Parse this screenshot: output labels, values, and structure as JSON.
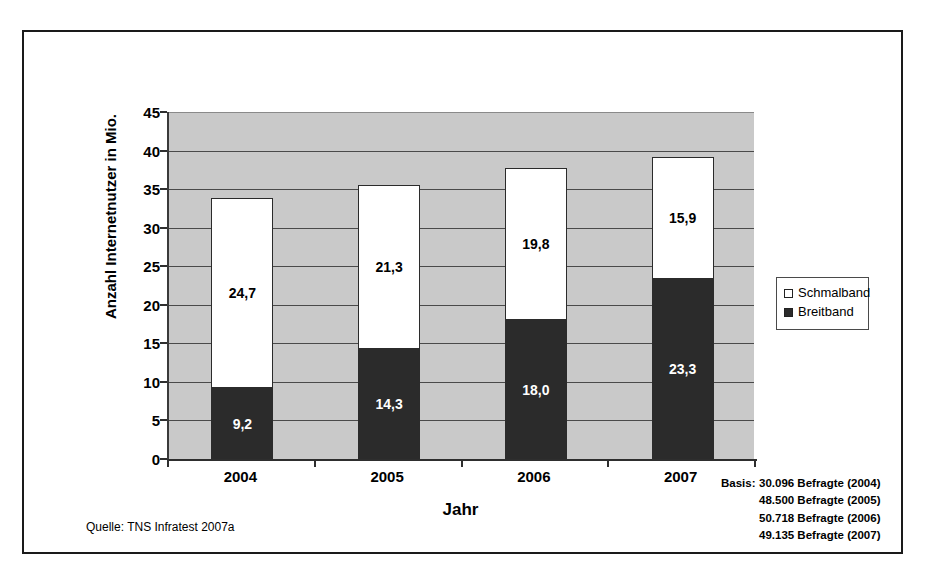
{
  "figure": {
    "source_note": "Quelle: TNS Infratest 2007a",
    "basis": {
      "label": "Basis:",
      "lines": [
        "30.096 Befragte (2004)",
        "48.500 Befragte (2005)",
        "50.718 Befragte (2006)",
        "49.135 Befragte (2007)"
      ]
    }
  },
  "legend": {
    "items": [
      {
        "label": "Schmalband",
        "swatch": "white-square-icon",
        "color": "#ffffff"
      },
      {
        "label": "Breitband",
        "swatch": "black-square-icon",
        "color": "#2b2b2b"
      }
    ]
  },
  "chart_data": {
    "type": "bar",
    "stacked": true,
    "title": "",
    "xlabel": "Jahr",
    "ylabel": "Anzahl Internetnutzer in Mio.",
    "categories": [
      "2004",
      "2005",
      "2006",
      "2007"
    ],
    "series": [
      {
        "name": "Breitband",
        "values": [
          9.2,
          14.3,
          18.0,
          23.3
        ],
        "labels": [
          "9,2",
          "14,3",
          "18,0",
          "23,3"
        ],
        "color": "#2b2b2b"
      },
      {
        "name": "Schmalband",
        "values": [
          24.7,
          21.3,
          19.8,
          15.9
        ],
        "labels": [
          "24,7",
          "21,3",
          "19,8",
          "15,9"
        ],
        "color": "#ffffff"
      }
    ],
    "totals": [
      33.9,
      35.6,
      37.8,
      39.2
    ],
    "ylim": [
      0,
      45
    ],
    "yticks": [
      0,
      5,
      10,
      15,
      20,
      25,
      30,
      35,
      40,
      45
    ],
    "ytick_labels": [
      "0",
      "5",
      "10",
      "15",
      "20",
      "25",
      "30",
      "35",
      "40",
      "45"
    ],
    "grid": true,
    "legend_position": "right",
    "plot_background": "#c9c9c9"
  }
}
